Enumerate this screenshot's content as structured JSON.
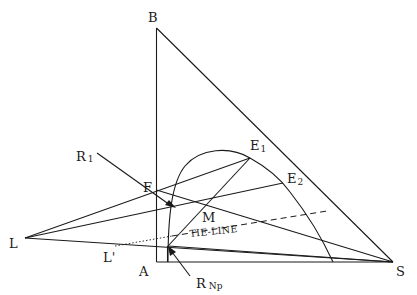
{
  "diagram": {
    "type": "ternary-extraction-diagram",
    "labels": {
      "B": "B",
      "A": "A",
      "S": "S",
      "L": "L",
      "L_prime": "L'",
      "F": "F",
      "M": "M",
      "E1_main": "E",
      "E1_sub": "1",
      "E2_main": "E",
      "E2_sub": "2",
      "R1_main": "R",
      "R1_sub": "1",
      "RNp_main": "R",
      "RNp_sub": "Np",
      "tie_line": "TIE-LINE"
    },
    "colors": {
      "line": "#1a1a1a",
      "background": "#ffffff"
    }
  }
}
